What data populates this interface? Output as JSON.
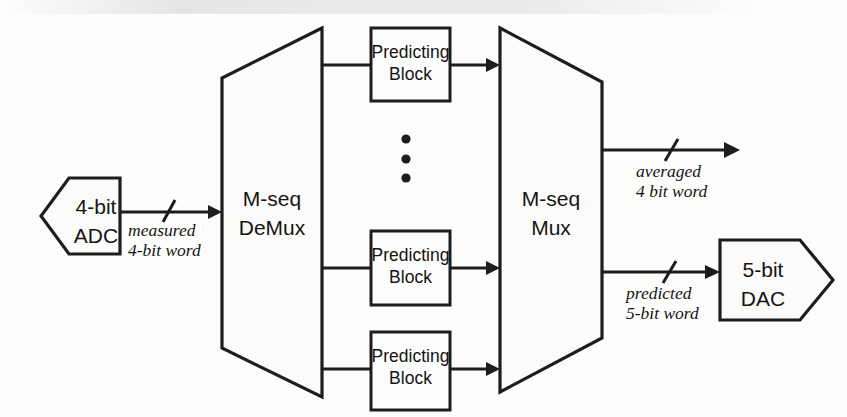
{
  "diagram": {
    "colors": {
      "line": "#1d1d1d",
      "fill": "#fbfbfa",
      "background": "#fdfdfc"
    },
    "blocks": {
      "adc": {
        "line1": "4-bit",
        "line2": "ADC",
        "shape": "pentagon-left"
      },
      "demux": {
        "line1": "M-seq",
        "line2": "DeMux",
        "shape": "trapezoid-expanding"
      },
      "mux": {
        "line1": "M-seq",
        "line2": "Mux",
        "shape": "trapezoid-contracting"
      },
      "dac": {
        "line1": "5-bit",
        "line2": "DAC",
        "shape": "pentagon-right"
      },
      "predicting": [
        {
          "line1": "Predicting",
          "line2": "Block",
          "position": "top"
        },
        {
          "line1": "Predicting",
          "line2": "Block",
          "position": "middle"
        },
        {
          "line1": "Predicting",
          "line2": "Block",
          "position": "bottom"
        }
      ]
    },
    "wire_labels": {
      "input": {
        "line1": "measured",
        "line2": "4-bit word"
      },
      "output_top": {
        "line1": "averaged",
        "line2": "4 bit word"
      },
      "output_bottom": {
        "line1": "predicted",
        "line2": "5-bit word"
      }
    },
    "ellipsis": {
      "name": "vertical-ellipsis",
      "dot_count": 3
    }
  }
}
